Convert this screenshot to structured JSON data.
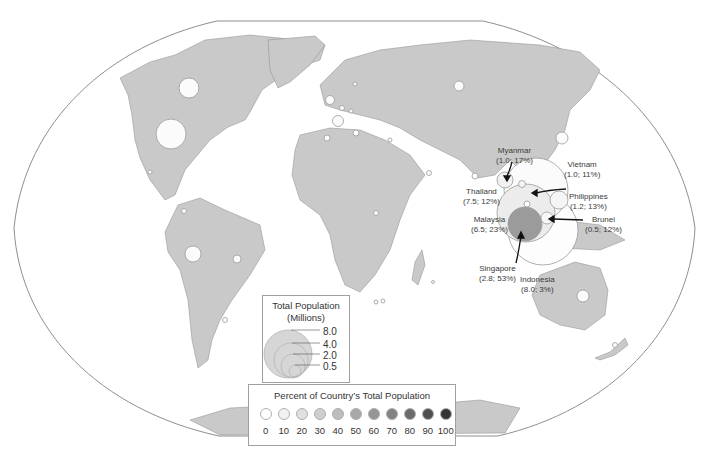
{
  "chart_data": {
    "type": "bubble-map",
    "title": "",
    "projection": "Winkel tripel (world)",
    "encoding": {
      "size": "Total Population (Millions)",
      "color": "Percent of Country's Total Population"
    },
    "labeled_points": [
      {
        "country": "Myanmar",
        "population_millions": 1.0,
        "percent": 17
      },
      {
        "country": "Vietnam",
        "population_millions": 1.0,
        "percent": 11
      },
      {
        "country": "Thailand",
        "population_millions": 7.5,
        "percent": 12
      },
      {
        "country": "Philippines",
        "population_millions": 1.2,
        "percent": 13
      },
      {
        "country": "Malaysia",
        "population_millions": 6.5,
        "percent": 23
      },
      {
        "country": "Brunei",
        "population_millions": 0.5,
        "percent": 12
      },
      {
        "country": "Singapore",
        "population_millions": 2.8,
        "percent": 53
      },
      {
        "country": "Indonesia",
        "population_millions": 8.0,
        "percent": 3
      }
    ],
    "size_legend": {
      "title": "Total Population (Millions)",
      "values": [
        8.0,
        4.0,
        2.0,
        0.5
      ]
    },
    "color_legend": {
      "title": "Percent of Country's Total Population",
      "values": [
        0,
        10,
        20,
        30,
        40,
        50,
        60,
        70,
        80,
        90,
        100
      ]
    }
  },
  "labels": {
    "myanmar": {
      "name": "Myanmar",
      "value": "(1.0; 17%)"
    },
    "vietnam": {
      "name": "Vietnam",
      "value": "(1.0; 11%)"
    },
    "thailand": {
      "name": "Thailand",
      "value": "(7.5; 12%)"
    },
    "philippines": {
      "name": "Philippines",
      "value": "(1.2; 13%)"
    },
    "malaysia": {
      "name": "Malaysia",
      "value": "(6.5; 23%)"
    },
    "brunei": {
      "name": "Brunei",
      "value": "(0.5; 12%)"
    },
    "singapore": {
      "name": "Singapore",
      "value": "(2.8; 53%)"
    },
    "indonesia": {
      "name": "Indonesia",
      "value": "(8.0; 3%)"
    }
  },
  "size_legend": {
    "title_line1": "Total Population",
    "title_line2": "(Millions)",
    "values": [
      "8.0",
      "4.0",
      "2.0",
      "0.5"
    ]
  },
  "pct_legend": {
    "title": "Percent of Country’s Total Population",
    "items": [
      {
        "label": "0",
        "color": "#ffffff"
      },
      {
        "label": "10",
        "color": "#f2f2f2"
      },
      {
        "label": "20",
        "color": "#e0e0e0"
      },
      {
        "label": "30",
        "color": "#cfcfcf"
      },
      {
        "label": "40",
        "color": "#bdbdbd"
      },
      {
        "label": "50",
        "color": "#a8a8a8"
      },
      {
        "label": "60",
        "color": "#959595"
      },
      {
        "label": "70",
        "color": "#828282"
      },
      {
        "label": "80",
        "color": "#6a6a6a"
      },
      {
        "label": "90",
        "color": "#505050"
      },
      {
        "label": "100",
        "color": "#353535"
      }
    ]
  }
}
